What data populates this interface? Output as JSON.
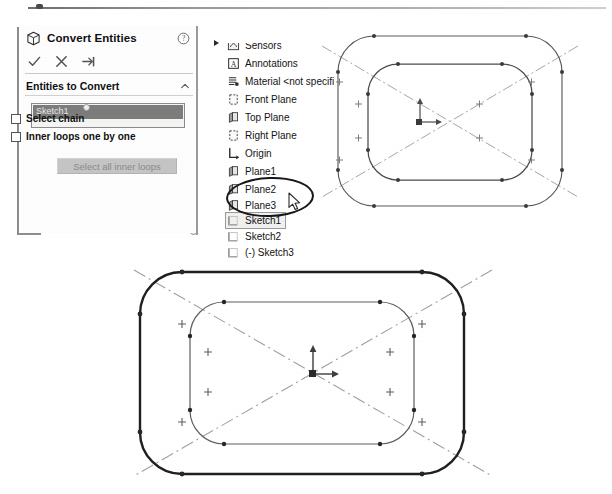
{
  "document": {
    "app": "SolidWorks",
    "view_label": "Sketch graphics area"
  },
  "property_manager": {
    "title": "Convert Entities",
    "title_icon": "cube-icon",
    "help_icon": "help-question-icon",
    "actions": [
      {
        "name": "ok",
        "icon": "checkmark-icon",
        "tooltip": "OK"
      },
      {
        "name": "cancel",
        "icon": "x-cross-icon",
        "tooltip": "Cancel"
      },
      {
        "name": "detach",
        "icon": "pushpin-detach-icon",
        "tooltip": "Detach/Keep visible"
      }
    ],
    "section": {
      "title": "Entities to Convert",
      "collapse_icon": "chevron-up-icon"
    },
    "selection_list": {
      "items": [
        "Sketch1"
      ],
      "selected_bg": "#7c7c7c",
      "selected_fg": "#e8e8e8"
    },
    "checkboxes": [
      {
        "label": "Select chain",
        "checked": false
      },
      {
        "label": "Inner loops one by one",
        "checked": false
      }
    ],
    "button": {
      "label": "Select all inner loops",
      "enabled": false
    }
  },
  "feature_tree": {
    "rows": [
      {
        "label": "Sensors",
        "icon": "sensors-icon",
        "top": 18,
        "clipped": true,
        "partial": true
      },
      {
        "label": "Annotations",
        "icon": "annotations-a-icon",
        "top": 36,
        "clipped": false,
        "partial": false
      },
      {
        "label": "Material <not specifi",
        "icon": "material-icon",
        "top": 54,
        "clipped": true,
        "partial": false
      },
      {
        "label": "Front Plane",
        "icon": "plane-icon",
        "top": 72,
        "clipped": false,
        "partial": false
      },
      {
        "label": "Top Plane",
        "icon": "plane-solid-icon",
        "top": 90,
        "clipped": false,
        "partial": false
      },
      {
        "label": "Right Plane",
        "icon": "plane-icon",
        "top": 108,
        "clipped": false,
        "partial": false
      },
      {
        "label": "Origin",
        "icon": "origin-axes-icon",
        "top": 126,
        "clipped": false,
        "partial": false
      },
      {
        "label": "Plane1",
        "icon": "plane-solid-icon",
        "top": 144,
        "clipped": false,
        "partial": false
      },
      {
        "label": "Plane2",
        "icon": "plane-solid-icon",
        "top": 162,
        "clipped": false,
        "partial": false
      },
      {
        "label": "Plane3",
        "icon": "plane-solid-icon",
        "top": 178,
        "clipped": false,
        "partial": true
      }
    ],
    "sketch_rows": [
      {
        "label": "Sketch1",
        "icon": "sketch-icon",
        "top": 194,
        "selected": true
      },
      {
        "label": "Sketch2",
        "icon": "sketch-icon",
        "top": 209,
        "selected": false
      },
      {
        "label": "(-) Sketch3",
        "icon": "sketch-icon",
        "top": 225,
        "selected": false
      }
    ],
    "expand_arrow_icon": "triangle-right-icon",
    "annotation": {
      "shape": "hand-drawn-ellipse",
      "encircles": [
        "Sketch1",
        "Sketch2"
      ],
      "color": "#171717"
    },
    "cursor_icon": "mouse-arrow-cursor"
  },
  "cad_views": [
    {
      "name": "upper-sketch-view",
      "outer_profile": "rounded-rectangle",
      "inner_profile": "rounded-rectangle",
      "outer_weight": "thin",
      "inner_weight": "thin",
      "construction_lines": "diagonal-centerlines",
      "origin_marker": "origin-axes",
      "endpoint_markers": "filled-dots",
      "midpoint_markers": "plus-crosses"
    },
    {
      "name": "lower-sketch-view",
      "outer_profile": "rounded-rectangle",
      "inner_profile": "rounded-rectangle",
      "outer_weight": "bold-converted",
      "inner_weight": "thin",
      "construction_lines": "diagonal-centerlines",
      "origin_marker": "origin-axes",
      "endpoint_markers": "filled-dots",
      "midpoint_markers": "plus-crosses"
    }
  ],
  "colors": {
    "sketch_line": "#4c4c4c",
    "converted_line": "#1f1f1f",
    "construction_line": "#9a9a9a",
    "point_marker": "#3a3a3a",
    "panel_bg": "#fdfdfd",
    "rail": "#8d8d8d"
  }
}
